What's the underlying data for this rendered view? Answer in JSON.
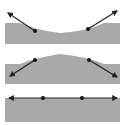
{
  "diagram": {
    "colors": {
      "surface": "#a9a9a9",
      "line": "#222222",
      "background": "#ffffff"
    },
    "panels": [
      {
        "id": "concave",
        "label": "Concave surface",
        "points": [
          [
            35,
            31
          ],
          [
            88,
            29
          ]
        ],
        "arrow_tips": [
          [
            8,
            13
          ],
          [
            117,
            11
          ]
        ]
      },
      {
        "id": "convex",
        "label": "Convex surface",
        "points": [
          [
            35,
            60
          ],
          [
            89,
            60
          ]
        ],
        "arrow_tips": [
          [
            10,
            76
          ],
          [
            117,
            77
          ]
        ]
      },
      {
        "id": "flat",
        "label": "Flat surface",
        "points": [
          [
            43,
            98
          ],
          [
            82,
            98
          ]
        ],
        "arrow_tips": [
          [
            9,
            98
          ],
          [
            117,
            98
          ]
        ]
      }
    ]
  }
}
